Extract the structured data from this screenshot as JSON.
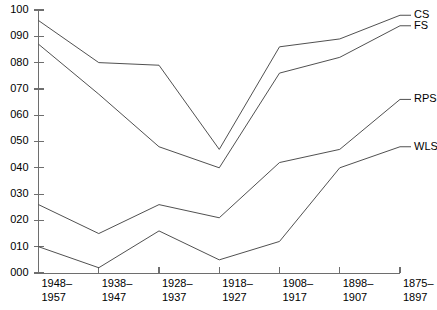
{
  "chart_data": {
    "type": "line",
    "title": "",
    "subtitle": "",
    "xlabel": "",
    "ylabel": "",
    "grid": false,
    "legend_position": "right-inline-labels",
    "ylim": [
      0,
      100
    ],
    "ytick_labels": [
      "000",
      "010",
      "020",
      "030",
      "040",
      "050",
      "060",
      "070",
      "080",
      "090",
      "100"
    ],
    "ytick_values": [
      0,
      10,
      20,
      30,
      40,
      50,
      60,
      70,
      80,
      90,
      100
    ],
    "categories": [
      "1948–\n1957",
      "1938–\n1947",
      "1928–\n1937",
      "1918–\n1927",
      "1908–\n1917",
      "1898–\n1907",
      "1875–\n1897"
    ],
    "xtick_labels_line1": [
      "1948–",
      "1938–",
      "1928–",
      "1918–",
      "1908–",
      "1898–",
      "1875–"
    ],
    "xtick_labels_line2": [
      "1957",
      "1947",
      "1937",
      "1927",
      "1917",
      "1907",
      "1897"
    ],
    "series": [
      {
        "name": "CS",
        "values": [
          96,
          80,
          79,
          47,
          86,
          89,
          98
        ]
      },
      {
        "name": "FS",
        "values": [
          87,
          68,
          48,
          40,
          76,
          82,
          94
        ]
      },
      {
        "name": "RPS",
        "values": [
          26,
          15,
          26,
          21,
          42,
          47,
          66
        ]
      },
      {
        "name": "WLS",
        "values": [
          10,
          2,
          16,
          5,
          12,
          40,
          48
        ]
      }
    ]
  },
  "legend": {
    "items": [
      {
        "label": "CS"
      },
      {
        "label": "FS"
      },
      {
        "label": "RPS"
      },
      {
        "label": "WLS"
      }
    ]
  },
  "colors": {
    "line": "#3c3c3c",
    "axis": "#6e6e6e",
    "background": "#ffffff",
    "text": "#000000"
  }
}
